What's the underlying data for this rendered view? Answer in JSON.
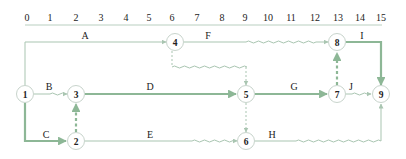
{
  "diagram": {
    "type": "time-scaled network diagram (double-code)",
    "colors": {
      "normal_line": "#a9c5b1",
      "critical_line": "#8db796",
      "axis_line": "#b9cfc0",
      "node_border": "#c8d4cc",
      "text": "#222222"
    },
    "time_axis": {
      "ticks": [
        "0",
        "1",
        "2",
        "3",
        "4",
        "5",
        "6",
        "7",
        "8",
        "9",
        "10",
        "11",
        "12",
        "13",
        "14",
        "15"
      ]
    },
    "nodes": [
      {
        "id": "1",
        "label": "1"
      },
      {
        "id": "2",
        "label": "2"
      },
      {
        "id": "3",
        "label": "3"
      },
      {
        "id": "4",
        "label": "4"
      },
      {
        "id": "5",
        "label": "5"
      },
      {
        "id": "6",
        "label": "6"
      },
      {
        "id": "7",
        "label": "7"
      },
      {
        "id": "8",
        "label": "8"
      },
      {
        "id": "9",
        "label": "9"
      }
    ],
    "activities": [
      {
        "name": "A",
        "from": "1",
        "to": "4",
        "critical": false
      },
      {
        "name": "B",
        "from": "1",
        "to": "3",
        "critical": false,
        "free_float": true
      },
      {
        "name": "C",
        "from": "1",
        "to": "2",
        "critical": true
      },
      {
        "name": "D",
        "from": "3",
        "to": "5",
        "critical": true
      },
      {
        "name": "E",
        "from": "2",
        "to": "6",
        "critical": false,
        "free_float": true
      },
      {
        "name": "F",
        "from": "4",
        "to": "8",
        "critical": false,
        "free_float": true
      },
      {
        "name": "G",
        "from": "5",
        "to": "7",
        "critical": true
      },
      {
        "name": "H",
        "from": "6",
        "to": "9",
        "critical": false,
        "free_float": true
      },
      {
        "name": "I",
        "from": "8",
        "to": "9",
        "critical": true
      },
      {
        "name": "J",
        "from": "7",
        "to": "9",
        "critical": false,
        "free_float": true
      }
    ],
    "dummies": [
      {
        "from": "2",
        "to": "3",
        "critical": true
      },
      {
        "from": "4",
        "to": "5",
        "critical": false
      },
      {
        "from": "5",
        "to": "6",
        "critical": false
      },
      {
        "from": "7",
        "to": "8",
        "critical": true
      }
    ]
  }
}
